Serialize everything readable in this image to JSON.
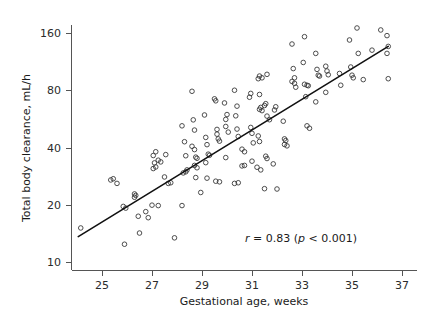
{
  "chart_data": {
    "type": "scatter",
    "title": "",
    "xlabel": "Gestational age, weeks",
    "ylabel": "Total body clearance, mL/h",
    "xlim": [
      23.9,
      37.4
    ],
    "ylim": [
      9.0,
      190.0
    ],
    "yscale": "log",
    "xscale": "linear",
    "grid": false,
    "legend": null,
    "xticks": [
      25,
      27,
      29,
      31,
      33,
      35,
      37
    ],
    "xtick_labels": [
      "25",
      "27",
      "29",
      "31",
      "33",
      "35",
      "37"
    ],
    "yticks": [
      10,
      20,
      40,
      80,
      160
    ],
    "ytick_labels": [
      "10",
      "20",
      "40",
      "80",
      "160"
    ],
    "annotations": [
      {
        "name": "correlation-annotation",
        "text": "r = 0.83 (p < 0.001)",
        "parts": [
          "r",
          " = 0.83 (",
          "p",
          " < 0.001)"
        ],
        "r_value": 0.83,
        "p_value": "< 0.001",
        "x": 31.9,
        "y": 13.2
      }
    ],
    "fit_line": {
      "name": "regression-line",
      "x_start": 24.05,
      "y_start": 13.6,
      "x_end": 36.45,
      "y_end": 136.0
    },
    "series": [
      {
        "name": "Total body clearance vs gestational age",
        "marker": "open-circle",
        "color": "#3a3a3a",
        "points": [
          [
            24.15,
            15.1
          ],
          [
            25.35,
            27.0
          ],
          [
            25.45,
            27.4
          ],
          [
            25.6,
            25.9
          ],
          [
            25.85,
            19.6
          ],
          [
            25.95,
            19.2
          ],
          [
            25.9,
            12.4
          ],
          [
            26.3,
            21.9
          ],
          [
            26.35,
            22.4
          ],
          [
            26.3,
            22.8
          ],
          [
            26.45,
            17.4
          ],
          [
            26.5,
            14.2
          ],
          [
            26.75,
            18.4
          ],
          [
            26.85,
            17.1
          ],
          [
            27.05,
            36.3
          ],
          [
            27.1,
            33.2
          ],
          [
            27.15,
            31.6
          ],
          [
            27.05,
            31.0
          ],
          [
            27.15,
            38.0
          ],
          [
            27.25,
            34.3
          ],
          [
            27.35,
            33.6
          ],
          [
            27.0,
            19.9
          ],
          [
            27.25,
            19.8
          ],
          [
            27.5,
            28.0
          ],
          [
            27.55,
            36.7
          ],
          [
            27.65,
            25.9
          ],
          [
            27.75,
            26.1
          ],
          [
            27.9,
            13.4
          ],
          [
            28.2,
            52.0
          ],
          [
            28.3,
            42.9
          ],
          [
            28.35,
            36.2
          ],
          [
            28.25,
            29.4
          ],
          [
            28.35,
            29.8
          ],
          [
            28.4,
            30.5
          ],
          [
            28.2,
            19.8
          ],
          [
            28.6,
            79.0
          ],
          [
            28.65,
            55.9
          ],
          [
            28.7,
            49.4
          ],
          [
            28.6,
            40.6
          ],
          [
            28.7,
            39.0
          ],
          [
            28.75,
            35.6
          ],
          [
            28.8,
            35.1
          ],
          [
            28.7,
            32.2
          ],
          [
            28.8,
            31.3
          ],
          [
            28.75,
            27.8
          ],
          [
            28.95,
            23.2
          ],
          [
            29.1,
            59.3
          ],
          [
            29.15,
            45.2
          ],
          [
            29.2,
            41.4
          ],
          [
            29.25,
            36.9
          ],
          [
            29.3,
            36.4
          ],
          [
            29.15,
            33.3
          ],
          [
            29.2,
            27.6
          ],
          [
            29.5,
            72.1
          ],
          [
            29.55,
            70.4
          ],
          [
            29.6,
            49.8
          ],
          [
            29.6,
            47.0
          ],
          [
            29.65,
            44.4
          ],
          [
            29.7,
            43.2
          ],
          [
            29.55,
            26.6
          ],
          [
            29.7,
            26.4
          ],
          [
            29.9,
            68.6
          ],
          [
            29.95,
            56.2
          ],
          [
            29.95,
            51.6
          ],
          [
            30.0,
            59.6
          ],
          [
            30.05,
            48.2
          ],
          [
            29.95,
            35.4
          ],
          [
            30.3,
            80.0
          ],
          [
            30.4,
            66.0
          ],
          [
            30.35,
            58.7
          ],
          [
            30.4,
            50.0
          ],
          [
            30.45,
            45.7
          ],
          [
            30.3,
            25.9
          ],
          [
            30.45,
            26.1
          ],
          [
            30.6,
            39.2
          ],
          [
            30.7,
            38.0
          ],
          [
            30.6,
            32.0
          ],
          [
            30.7,
            32.2
          ],
          [
            30.95,
            77.0
          ],
          [
            30.9,
            73.5
          ],
          [
            30.95,
            51.0
          ],
          [
            31.0,
            47.5
          ],
          [
            31.05,
            42.3
          ],
          [
            31.0,
            33.9
          ],
          [
            31.25,
            92.0
          ],
          [
            31.3,
            95.0
          ],
          [
            31.4,
            93.0
          ],
          [
            31.3,
            76.0
          ],
          [
            31.35,
            65.0
          ],
          [
            31.3,
            63.5
          ],
          [
            31.4,
            62.5
          ],
          [
            31.25,
            46.0
          ],
          [
            31.3,
            43.0
          ],
          [
            31.2,
            31.5
          ],
          [
            31.35,
            30.5
          ],
          [
            31.6,
            97.0
          ],
          [
            31.55,
            68.0
          ],
          [
            31.5,
            66.5
          ],
          [
            31.6,
            58.5
          ],
          [
            31.7,
            56.0
          ],
          [
            31.55,
            36.0
          ],
          [
            31.6,
            35.0
          ],
          [
            31.5,
            24.3
          ],
          [
            31.95,
            65.5
          ],
          [
            31.9,
            63.0
          ],
          [
            31.85,
            32.8
          ],
          [
            32.0,
            24.2
          ],
          [
            32.25,
            55.0
          ],
          [
            32.3,
            44.4
          ],
          [
            32.35,
            43.5
          ],
          [
            32.3,
            41.5
          ],
          [
            32.4,
            40.8
          ],
          [
            32.6,
            140.0
          ],
          [
            32.65,
            104.0
          ],
          [
            32.7,
            93.0
          ],
          [
            32.6,
            89.0
          ],
          [
            32.7,
            87.0
          ],
          [
            32.75,
            83.0
          ],
          [
            33.1,
            153.0
          ],
          [
            33.05,
            112.0
          ],
          [
            33.1,
            86.0
          ],
          [
            33.2,
            85.0
          ],
          [
            33.25,
            84.5
          ],
          [
            33.15,
            74.0
          ],
          [
            33.2,
            52.0
          ],
          [
            33.3,
            50.5
          ],
          [
            33.55,
            125.0
          ],
          [
            33.6,
            103.0
          ],
          [
            33.65,
            96.0
          ],
          [
            33.7,
            95.0
          ],
          [
            33.55,
            69.5
          ],
          [
            33.95,
            107.0
          ],
          [
            34.0,
            101.0
          ],
          [
            34.05,
            96.5
          ],
          [
            33.95,
            78.0
          ],
          [
            34.5,
            98.0
          ],
          [
            34.55,
            85.0
          ],
          [
            34.9,
            147.0
          ],
          [
            34.95,
            106.0
          ],
          [
            35.0,
            96.0
          ],
          [
            35.05,
            93.0
          ],
          [
            35.2,
            170.0
          ],
          [
            35.25,
            125.0
          ],
          [
            35.45,
            91.0
          ],
          [
            35.8,
            130.0
          ],
          [
            36.15,
            166.0
          ],
          [
            36.4,
            155.0
          ],
          [
            36.45,
            136.0
          ],
          [
            36.4,
            125.0
          ],
          [
            36.45,
            92.0
          ]
        ]
      }
    ]
  },
  "figure": {
    "background": "#ffffff",
    "axis_color": "#555555",
    "marker_color": "#3a3a3a",
    "line_color": "#111111"
  }
}
